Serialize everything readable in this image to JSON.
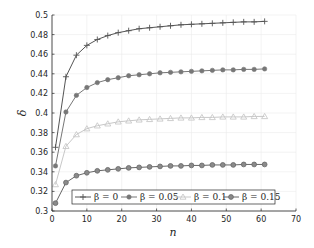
{
  "chart_data": {
    "type": "line",
    "title": "",
    "xlabel": "n",
    "ylabel": "δ",
    "xlim": [
      0,
      70
    ],
    "ylim": [
      0.3,
      0.5
    ],
    "xticks": [
      0,
      10,
      20,
      30,
      40,
      50,
      60,
      70
    ],
    "yticks": [
      0.3,
      0.32,
      0.34,
      0.36,
      0.38,
      0.4,
      0.42,
      0.44,
      0.46,
      0.48,
      0.5
    ],
    "ytick_labels": [
      "0.3",
      "0.32",
      "0.34",
      "0.36",
      "0.38",
      "0.4",
      "0.42",
      "0.44",
      "0.46",
      "0.48",
      "0.5"
    ],
    "grid": true,
    "legend_position": "bottom-inside, horizontal",
    "x": [
      1,
      4,
      7,
      10,
      13,
      16,
      19,
      22,
      25,
      28,
      31,
      34,
      37,
      40,
      43,
      46,
      49,
      52,
      55,
      58,
      61
    ],
    "series": [
      {
        "name": "β = 0",
        "marker": "plus",
        "color": "#555555",
        "values": [
          0.365,
          0.437,
          0.459,
          0.469,
          0.475,
          0.479,
          0.482,
          0.484,
          0.486,
          0.487,
          0.488,
          0.489,
          0.49,
          0.4905,
          0.491,
          0.4915,
          0.492,
          0.4925,
          0.493,
          0.493,
          0.4935
        ]
      },
      {
        "name": "β = 0.05",
        "marker": "asterisk",
        "color": "#777777",
        "values": [
          0.346,
          0.401,
          0.418,
          0.426,
          0.431,
          0.434,
          0.436,
          0.438,
          0.439,
          0.44,
          0.441,
          0.4415,
          0.442,
          0.4425,
          0.443,
          0.4435,
          0.444,
          0.444,
          0.4445,
          0.4445,
          0.445
        ]
      },
      {
        "name": "β = 0.1",
        "marker": "triangle",
        "color": "#c8c8c8",
        "values": [
          0.327,
          0.366,
          0.378,
          0.384,
          0.387,
          0.389,
          0.391,
          0.392,
          0.393,
          0.3935,
          0.394,
          0.3945,
          0.395,
          0.395,
          0.3955,
          0.3955,
          0.396,
          0.396,
          0.396,
          0.3965,
          0.3965
        ]
      },
      {
        "name": "β = 0.15",
        "marker": "circle",
        "color": "#666666",
        "values": [
          0.308,
          0.329,
          0.336,
          0.339,
          0.341,
          0.342,
          0.343,
          0.344,
          0.3445,
          0.345,
          0.3455,
          0.346,
          0.346,
          0.3465,
          0.3465,
          0.347,
          0.347,
          0.347,
          0.3475,
          0.3475,
          0.3475
        ]
      }
    ]
  }
}
